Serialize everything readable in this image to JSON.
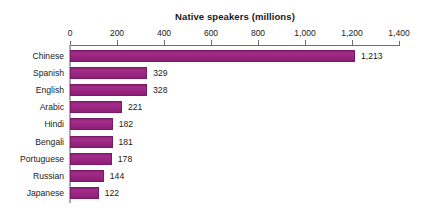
{
  "chart_data": {
    "type": "bar",
    "orientation": "horizontal",
    "title": "Native speakers (millions)",
    "xlabel": "",
    "ylabel": "",
    "categories": [
      "Chinese",
      "Spanish",
      "English",
      "Arabic",
      "Hindi",
      "Bengali",
      "Portuguese",
      "Russian",
      "Japanese"
    ],
    "values": [
      1213,
      329,
      328,
      221,
      182,
      181,
      178,
      144,
      122
    ],
    "value_labels": [
      "1,213",
      "329",
      "328",
      "221",
      "182",
      "181",
      "178",
      "144",
      "122"
    ],
    "xlim": [
      0,
      1400
    ],
    "xticks": [
      0,
      200,
      400,
      600,
      800,
      1000,
      1200,
      1400
    ],
    "xtick_labels": [
      "0",
      "200",
      "400",
      "600",
      "800",
      "1,000",
      "1,200",
      "1,400"
    ],
    "grid": false,
    "legend": null,
    "bar_color": "#9b2682",
    "axis_color": "#6d6e71",
    "text_color": "#1a1a1a",
    "background": "#ffffff"
  }
}
